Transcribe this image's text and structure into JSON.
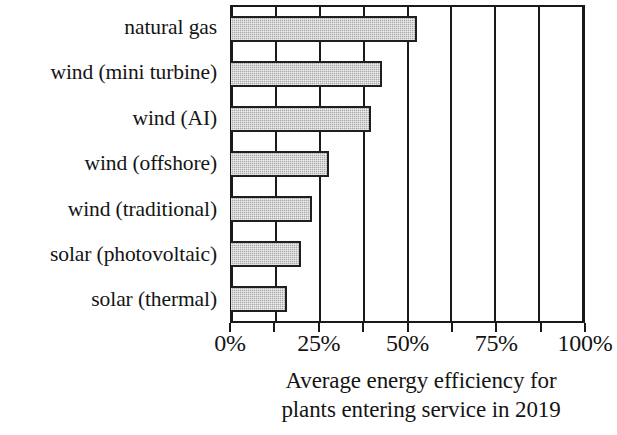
{
  "chart_data": {
    "type": "bar",
    "orientation": "horizontal",
    "title": "",
    "xlabel": "Average energy efficiency for plants entering service in 2019",
    "ylabel": "",
    "categories": [
      "natural gas",
      "wind (mini turbine)",
      "wind (AI)",
      "wind (offshore)",
      "wind (traditional)",
      "solar (photovoltaic)",
      "solar (thermal)"
    ],
    "values": [
      53,
      43,
      40,
      28,
      23,
      20,
      16
    ],
    "value_unit": "%",
    "xlim": [
      0,
      100
    ],
    "grid": true,
    "gridline_interval": 12.5,
    "gridline_values": [
      0,
      12.5,
      25,
      37.5,
      50,
      62.5,
      75,
      87.5,
      100
    ],
    "tick_values": [
      0,
      25,
      50,
      75,
      100
    ],
    "tick_labels": [
      "0%",
      "25%",
      "50%",
      "75%",
      "100%"
    ],
    "legend": null,
    "bar_fill_color": "#a9a9a9",
    "bar_border_color": "#1f1f1f",
    "axis_color": "#1a1a1a",
    "background_color": "#ffffff"
  },
  "axis_title": {
    "line1": "Average energy efficiency for",
    "line2": "plants entering service in 2019"
  }
}
